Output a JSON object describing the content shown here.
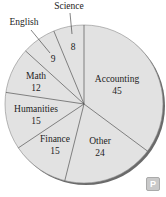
{
  "chart_data": {
    "type": "pie",
    "title": "",
    "categories": [
      "Accounting",
      "Other",
      "Finance",
      "Humanities",
      "Math",
      "English",
      "Science"
    ],
    "values": [
      45,
      24,
      15,
      15,
      12,
      9,
      8
    ],
    "total": 128,
    "slice_color": "#e2e2e2",
    "edge_color": "#555555",
    "shadow_color": "#666666",
    "labels": {
      "accounting": {
        "name": "Accounting",
        "value": "45"
      },
      "other": {
        "name": "Other",
        "value": "24"
      },
      "finance": {
        "name": "Finance",
        "value": "15"
      },
      "humanities": {
        "name": "Humanities",
        "value": "15"
      },
      "math": {
        "name": "Math",
        "value": "12"
      },
      "english": {
        "name": "English",
        "value": "9"
      },
      "science": {
        "name": "Science",
        "value": "8"
      }
    }
  },
  "badge": {
    "label": "P"
  }
}
